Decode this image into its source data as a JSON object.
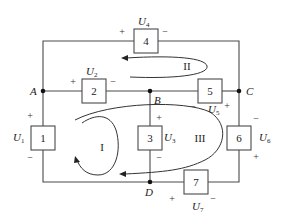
{
  "diagram": {
    "type": "circuit",
    "nodes": [
      {
        "id": "A",
        "label": "A"
      },
      {
        "id": "B",
        "label": "B"
      },
      {
        "id": "C",
        "label": "C"
      },
      {
        "id": "D",
        "label": "D"
      }
    ],
    "elements": [
      {
        "id": "1",
        "label": "1",
        "voltage": "U",
        "voltage_sub": "1",
        "plus": "+",
        "minus": "−",
        "between": [
          "A",
          "D"
        ]
      },
      {
        "id": "2",
        "label": "2",
        "voltage": "U",
        "voltage_sub": "2",
        "plus": "+",
        "minus": "−",
        "between": [
          "A",
          "B"
        ]
      },
      {
        "id": "3",
        "label": "3",
        "voltage": "U",
        "voltage_sub": "3",
        "plus": "+",
        "minus": "−",
        "between": [
          "B",
          "D"
        ]
      },
      {
        "id": "4",
        "label": "4",
        "voltage": "U",
        "voltage_sub": "4",
        "plus": "+",
        "minus": "−",
        "between": [
          "A",
          "C"
        ]
      },
      {
        "id": "5",
        "label": "5",
        "voltage": "U",
        "voltage_sub": "5",
        "plus": "+",
        "minus": "−",
        "between": [
          "B",
          "C"
        ]
      },
      {
        "id": "6",
        "label": "6",
        "voltage": "U",
        "voltage_sub": "6",
        "plus": "+",
        "minus": "−",
        "between": [
          "C",
          "D"
        ]
      },
      {
        "id": "7",
        "label": "7",
        "voltage": "U",
        "voltage_sub": "7",
        "plus": "+",
        "minus": "−",
        "between": [
          "D",
          "C"
        ]
      }
    ],
    "loops": [
      {
        "id": "I",
        "label": "I",
        "direction": "counterclockwise"
      },
      {
        "id": "II",
        "label": "II",
        "direction": "counterclockwise"
      },
      {
        "id": "III",
        "label": "III",
        "direction": "counterclockwise"
      }
    ]
  }
}
